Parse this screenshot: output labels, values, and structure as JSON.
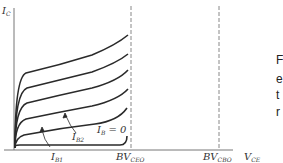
{
  "figure": {
    "y_axis_label": {
      "main": "I",
      "sub": "C"
    },
    "x_axis_label": {
      "main": "V",
      "sub": "CE"
    },
    "bv_ceo_label": {
      "main": "BV",
      "sub": "CEO"
    },
    "bv_cbo_label": {
      "main": "BV",
      "sub": "CBO"
    },
    "ib0_label": {
      "main": "I",
      "sub": "B",
      "suffix": " = 0"
    },
    "ib1_label": {
      "main": "I",
      "sub": "B1"
    },
    "ib2_label": {
      "main": "I",
      "sub": "B2"
    }
  },
  "side_text": [
    "F",
    "e",
    "t",
    "r"
  ],
  "colors": {
    "curve": "#2a2a2a",
    "axis": "#777777",
    "dashed": "#888888"
  }
}
